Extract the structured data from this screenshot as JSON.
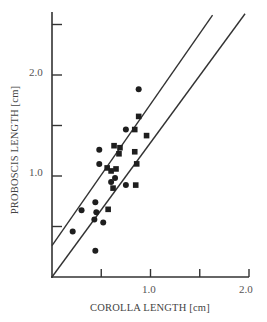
{
  "chart_data": {
    "type": "scatter",
    "title": "",
    "xlabel": "COROLLA LENGTH [cm]",
    "ylabel": "PROBOSCIS LENGTH [cm]",
    "xlim": [
      0,
      2.0
    ],
    "ylim": [
      0,
      2.6
    ],
    "x_ticks": [
      0.5,
      1.0,
      1.5,
      2.0
    ],
    "x_tick_labels": [
      "",
      "1.0",
      "",
      "2.0"
    ],
    "y_ticks": [
      0.5,
      1.0,
      1.5,
      2.0,
      2.5
    ],
    "y_tick_labels": [
      "",
      "1.0",
      "",
      "2.0",
      ""
    ],
    "grid": false,
    "legend": null,
    "series": [
      {
        "name": "circles",
        "marker": "circle",
        "points": [
          [
            0.88,
            1.86
          ],
          [
            0.75,
            1.46
          ],
          [
            0.48,
            1.26
          ],
          [
            0.48,
            1.12
          ],
          [
            0.64,
            0.98
          ],
          [
            0.6,
            0.94
          ],
          [
            0.75,
            0.91
          ],
          [
            0.44,
            0.74
          ],
          [
            0.3,
            0.66
          ],
          [
            0.45,
            0.64
          ],
          [
            0.43,
            0.57
          ],
          [
            0.52,
            0.54
          ],
          [
            0.21,
            0.45
          ],
          [
            0.44,
            0.26
          ]
        ]
      },
      {
        "name": "squares",
        "marker": "square",
        "points": [
          [
            0.88,
            1.59
          ],
          [
            0.84,
            1.46
          ],
          [
            0.96,
            1.4
          ],
          [
            0.63,
            1.3
          ],
          [
            0.69,
            1.28
          ],
          [
            0.68,
            1.22
          ],
          [
            0.84,
            1.24
          ],
          [
            0.86,
            1.12
          ],
          [
            0.56,
            1.08
          ],
          [
            0.6,
            1.05
          ],
          [
            0.65,
            1.07
          ],
          [
            0.85,
            0.91
          ],
          [
            0.62,
            0.88
          ],
          [
            0.57,
            0.67
          ]
        ]
      }
    ],
    "lines": [
      {
        "name": "regression-line-a",
        "intercept": 0.31,
        "slope": 1.4,
        "x_range": [
          0,
          1.63
        ]
      },
      {
        "name": "regression-line-b",
        "intercept": 0.0,
        "slope": 1.33,
        "x_range": [
          0,
          1.96
        ]
      }
    ]
  },
  "labels": {
    "x_axis": "COROLLA LENGTH [cm]",
    "y_axis": "PROBOSCIS LENGTH [cm]",
    "y_tick_1": "1.0",
    "y_tick_2": "2.0",
    "x_tick_1": "1.0",
    "x_tick_2": "2.0"
  }
}
